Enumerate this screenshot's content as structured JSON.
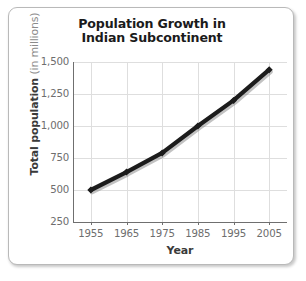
{
  "chart_data": {
    "type": "line",
    "title": "Population Growth in Indian Subcontinent",
    "title_line1": "Population Growth in",
    "title_line2": "Indian Subcontinent",
    "xlabel": "Year",
    "ylabel": "Total population",
    "ylabel_units": "(in millions)",
    "x": [
      1955,
      1965,
      1975,
      1985,
      1995,
      2005
    ],
    "xticklabels": [
      "1955",
      "1965",
      "1975",
      "1985",
      "1995",
      "2005"
    ],
    "values": [
      500,
      640,
      790,
      1000,
      1200,
      1440
    ],
    "yticks": [
      250,
      500,
      750,
      1000,
      1250,
      1500
    ],
    "yticklabels": [
      "250",
      "500",
      "750",
      "1,000",
      "1,250",
      "1,500"
    ],
    "ylim": [
      250,
      1500
    ],
    "xlim": [
      1950,
      2010
    ],
    "grid": true,
    "legend": "none",
    "series": [
      {
        "name": "Total population",
        "values": [
          500,
          640,
          790,
          1000,
          1200,
          1440
        ]
      }
    ],
    "colors": {
      "line": "#1c1c1c",
      "marker": "#1c1c1c",
      "grid": "#dedede",
      "axis": "#6f6f6f",
      "tick_text": "#6e6e6e",
      "title_text": "#1b1b1b",
      "axis_title_text": "#3a3a3a",
      "units_text": "#8b8b8b",
      "frame_border": "#b9b9b9",
      "background": "#ffffff"
    }
  }
}
